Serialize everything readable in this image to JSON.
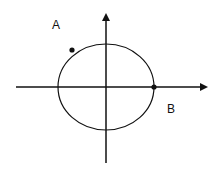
{
  "diagram": {
    "type": "unit-circle-with-axes",
    "stroke_color": "#111111",
    "background": "#ffffff",
    "axes": {
      "x_axis": {
        "from": [
          16,
          87
        ],
        "to": [
          208,
          87
        ],
        "arrow": "right"
      },
      "y_axis": {
        "from": [
          106,
          163
        ],
        "to": [
          106,
          13
        ],
        "arrow": "up"
      }
    },
    "circle": {
      "center": [
        106,
        87
      ],
      "rx": 48,
      "ry": 43
    },
    "points": [
      {
        "label": "A",
        "dot": [
          72,
          50
        ],
        "label_pos": [
          52,
          19
        ]
      },
      {
        "label": "B",
        "dot": [
          154,
          87
        ],
        "label_pos": [
          167,
          103
        ]
      }
    ]
  }
}
